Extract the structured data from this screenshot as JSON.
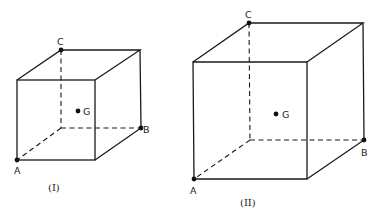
{
  "figures": [
    {
      "caption": "(I)",
      "labels": {
        "A": "A",
        "B": "B",
        "C": "C",
        "G": "G"
      },
      "front_face": [
        [
          17,
          80
        ],
        [
          95,
          80
        ],
        [
          95,
          160
        ],
        [
          17,
          160
        ]
      ],
      "back_top": [
        [
          61,
          50
        ],
        [
          140,
          50
        ]
      ],
      "points": {
        "A": [
          17,
          160
        ],
        "B": [
          141,
          128
        ],
        "C": [
          61,
          50
        ],
        "G": [
          78,
          111
        ]
      }
    },
    {
      "caption": "(II)",
      "labels": {
        "A": "A",
        "B": "B",
        "C": "C",
        "G": "G"
      },
      "front_face": [
        [
          193,
          62
        ],
        [
          307,
          62
        ],
        [
          307,
          179
        ],
        [
          194,
          179
        ]
      ],
      "back_top": [
        [
          249,
          23
        ],
        [
          363,
          23
        ]
      ],
      "points": {
        "A": [
          194,
          179
        ],
        "B": [
          364,
          140
        ],
        "C": [
          249,
          23
        ],
        "G": [
          276,
          114
        ]
      }
    }
  ],
  "colors": {
    "line": "#1a1a1a",
    "background": "#ffffff"
  }
}
